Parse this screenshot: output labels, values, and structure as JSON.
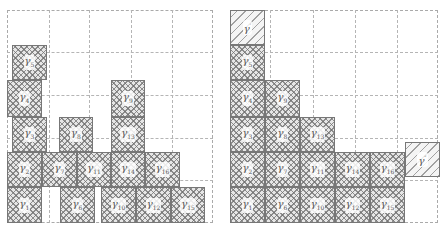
{
  "panels": [
    {
      "name": "left-panel",
      "grid": {
        "x": 7,
        "y": 10,
        "w": 206,
        "h": 213,
        "cols": [
          49,
          89,
          131,
          172
        ],
        "rows": [
          52,
          95,
          138,
          180
        ]
      },
      "boxes": [
        {
          "id": "gamma5",
          "sym": "γ",
          "sub": "5",
          "x": 12,
          "y": 45,
          "w": 35,
          "h": 35
        },
        {
          "id": "gamma4",
          "sym": "γ",
          "sub": "4",
          "x": 7,
          "y": 80,
          "w": 35,
          "h": 37
        },
        {
          "id": "gamma3",
          "sym": "γ",
          "sub": "3",
          "x": 12,
          "y": 117,
          "w": 35,
          "h": 35
        },
        {
          "id": "gamma8",
          "sym": "γ",
          "sub": "8",
          "x": 59,
          "y": 117,
          "w": 34,
          "h": 35
        },
        {
          "id": "gamma9",
          "sym": "γ",
          "sub": "9",
          "x": 111,
          "y": 80,
          "w": 34,
          "h": 37
        },
        {
          "id": "gamma13",
          "sym": "γ",
          "sub": "13",
          "x": 111,
          "y": 117,
          "w": 34,
          "h": 35
        },
        {
          "id": "gamma2",
          "sym": "γ",
          "sub": "2",
          "x": 7,
          "y": 152,
          "w": 35,
          "h": 35
        },
        {
          "id": "gamma7",
          "sym": "γ",
          "sub": "7",
          "x": 42,
          "y": 152,
          "w": 35,
          "h": 35
        },
        {
          "id": "gamma11",
          "sym": "γ",
          "sub": "11",
          "x": 77,
          "y": 152,
          "w": 34,
          "h": 35
        },
        {
          "id": "gamma14",
          "sym": "γ",
          "sub": "14",
          "x": 111,
          "y": 152,
          "w": 34,
          "h": 35
        },
        {
          "id": "gamma16",
          "sym": "γ",
          "sub": "16",
          "x": 145,
          "y": 152,
          "w": 35,
          "h": 35
        },
        {
          "id": "gamma1",
          "sym": "γ",
          "sub": "1",
          "x": 7,
          "y": 187,
          "w": 35,
          "h": 36
        },
        {
          "id": "gamma6",
          "sym": "γ",
          "sub": "6",
          "x": 60,
          "y": 187,
          "w": 35,
          "h": 36
        },
        {
          "id": "gamma10",
          "sym": "γ",
          "sub": "10",
          "x": 101,
          "y": 187,
          "w": 35,
          "h": 36
        },
        {
          "id": "gamma12",
          "sym": "γ",
          "sub": "12",
          "x": 136,
          "y": 187,
          "w": 35,
          "h": 36
        },
        {
          "id": "gamma15",
          "sym": "γ",
          "sub": "15",
          "x": 171,
          "y": 187,
          "w": 34,
          "h": 36
        }
      ]
    },
    {
      "name": "right-panel",
      "grid": {
        "x": 230,
        "y": 10,
        "w": 208,
        "h": 213,
        "cols": [
          270,
          313,
          355,
          397
        ],
        "rows": [
          52,
          95,
          138,
          180
        ]
      },
      "boxes": [
        {
          "id": "gamma-prime",
          "sym": "γ",
          "sup": "′",
          "x": 230,
          "y": 10,
          "w": 35,
          "h": 35,
          "style": "hatch"
        },
        {
          "id": "gamma5",
          "sym": "γ",
          "sub": "5",
          "x": 230,
          "y": 45,
          "w": 35,
          "h": 35
        },
        {
          "id": "gamma4",
          "sym": "γ",
          "sub": "4",
          "x": 230,
          "y": 80,
          "w": 35,
          "h": 37
        },
        {
          "id": "gamma9",
          "sym": "γ",
          "sub": "9",
          "x": 265,
          "y": 80,
          "w": 35,
          "h": 37
        },
        {
          "id": "gamma3",
          "sym": "γ",
          "sub": "3",
          "x": 230,
          "y": 117,
          "w": 35,
          "h": 35
        },
        {
          "id": "gamma8",
          "sym": "γ",
          "sub": "8",
          "x": 265,
          "y": 117,
          "w": 35,
          "h": 35
        },
        {
          "id": "gamma13",
          "sym": "γ",
          "sub": "13",
          "x": 300,
          "y": 117,
          "w": 35,
          "h": 35
        },
        {
          "id": "gamma2",
          "sym": "γ",
          "sub": "2",
          "x": 230,
          "y": 152,
          "w": 35,
          "h": 35
        },
        {
          "id": "gamma7",
          "sym": "γ",
          "sub": "7",
          "x": 265,
          "y": 152,
          "w": 35,
          "h": 35
        },
        {
          "id": "gamma11",
          "sym": "γ",
          "sub": "11",
          "x": 300,
          "y": 152,
          "w": 35,
          "h": 35
        },
        {
          "id": "gamma14",
          "sym": "γ",
          "sub": "14",
          "x": 335,
          "y": 152,
          "w": 35,
          "h": 35
        },
        {
          "id": "gamma16",
          "sym": "γ",
          "sub": "16",
          "x": 370,
          "y": 152,
          "w": 35,
          "h": 35
        },
        {
          "id": "gamma1",
          "sym": "γ",
          "sub": "1",
          "x": 230,
          "y": 187,
          "w": 35,
          "h": 36
        },
        {
          "id": "gamma6",
          "sym": "γ",
          "sub": "6",
          "x": 265,
          "y": 187,
          "w": 35,
          "h": 36
        },
        {
          "id": "gamma10",
          "sym": "γ",
          "sub": "10",
          "x": 300,
          "y": 187,
          "w": 35,
          "h": 36
        },
        {
          "id": "gamma12",
          "sym": "γ",
          "sub": "12",
          "x": 335,
          "y": 187,
          "w": 35,
          "h": 36
        },
        {
          "id": "gamma15",
          "sym": "γ",
          "sub": "15",
          "x": 370,
          "y": 187,
          "w": 35,
          "h": 36
        },
        {
          "id": "gamma-double-prime",
          "sym": "γ",
          "sup": "″",
          "x": 405,
          "y": 142,
          "w": 35,
          "h": 35,
          "style": "hatch"
        }
      ]
    }
  ]
}
